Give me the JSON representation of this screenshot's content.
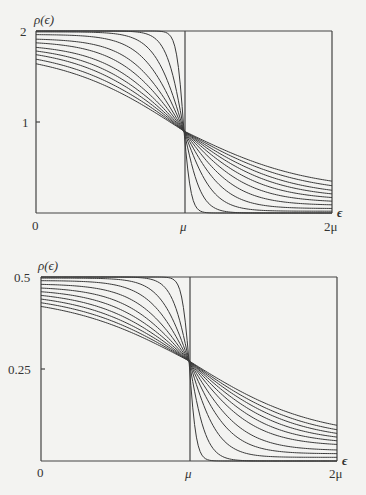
{
  "chart_data": [
    {
      "type": "line",
      "title": "",
      "ylabel": "ρ(ϵ)",
      "xlabel": "ϵ",
      "x_ticks": [
        "0",
        "μ",
        "2μ"
      ],
      "y_ticks": [
        "1",
        "2"
      ],
      "xlim": [
        0,
        2
      ],
      "ylim": [
        0,
        2
      ],
      "crossing": {
        "x": 1,
        "y": 0.9
      },
      "vertical_line_at": 1,
      "series_start_values": [
        2.0,
        2.0,
        1.99,
        1.96,
        1.91,
        1.87,
        1.82,
        1.78,
        1.74,
        1.69,
        1.64
      ],
      "series_end_values": [
        0.0,
        0.0,
        0.02,
        0.05,
        0.09,
        0.13,
        0.17,
        0.21,
        0.25,
        0.3,
        0.35
      ],
      "series_widths": [
        0.05,
        0.12,
        0.2,
        0.28,
        0.36,
        0.44,
        0.52,
        0.6,
        0.68,
        0.76,
        0.84
      ],
      "grid": false,
      "legend": "none"
    },
    {
      "type": "line",
      "title": "",
      "ylabel": "ρ(ϵ)",
      "xlabel": "ϵ",
      "x_ticks": [
        "0",
        "μ",
        "2μ"
      ],
      "y_ticks": [
        "0.25",
        "0.5"
      ],
      "xlim": [
        0,
        2
      ],
      "ylim": [
        0,
        0.5
      ],
      "crossing": {
        "x": 1,
        "y": 0.272
      },
      "vertical_line_at": 1,
      "series_start_values": [
        0.5,
        0.5,
        0.497,
        0.49,
        0.48,
        0.47,
        0.46,
        0.45,
        0.44,
        0.43,
        0.42
      ],
      "series_end_values": [
        0.0,
        0.0,
        0.01,
        0.02,
        0.03,
        0.045,
        0.055,
        0.065,
        0.075,
        0.085,
        0.097
      ],
      "series_widths": [
        0.05,
        0.12,
        0.2,
        0.28,
        0.36,
        0.44,
        0.52,
        0.6,
        0.68,
        0.76,
        0.84
      ],
      "grid": false,
      "legend": "none"
    }
  ],
  "layout": [
    {
      "left": 36,
      "right": 332,
      "top": 31,
      "bottom": 213,
      "mid": 185
    },
    {
      "left": 41,
      "right": 337,
      "top": 277,
      "bottom": 461,
      "mid": 190
    }
  ]
}
